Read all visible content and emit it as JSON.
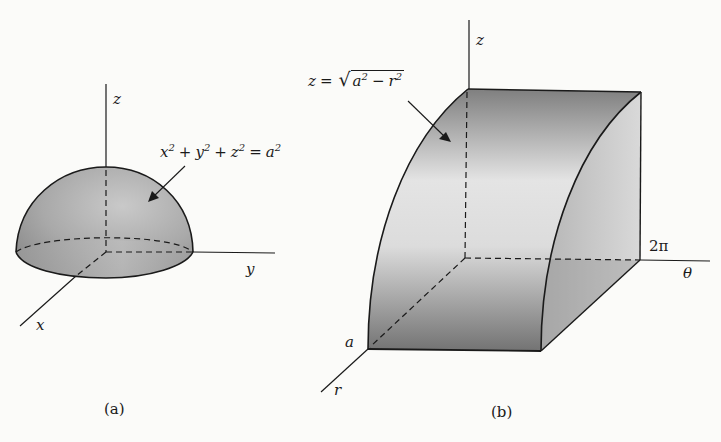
{
  "figure": {
    "panel_a": {
      "caption": "(a)",
      "axes": {
        "x": "x",
        "y": "y",
        "z": "z"
      },
      "surface_label": {
        "t1": "x",
        "e1": "2",
        "op1": "+",
        "t2": "y",
        "e2": "2",
        "op2": "+",
        "t3": "z",
        "e3": "2",
        "op3": "=",
        "t4": "a",
        "e4": "2"
      },
      "shape": "hemisphere"
    },
    "panel_b": {
      "caption": "(b)",
      "axes": {
        "r": "r",
        "theta": "θ",
        "z": "z"
      },
      "tick_labels": {
        "r_max": "a",
        "theta_max": "2π"
      },
      "surface_label": {
        "lhs": "z",
        "op": "=",
        "sqrt": "√",
        "t1": "a",
        "e1": "2",
        "minus": "−",
        "t2": "r",
        "e2": "2"
      },
      "shape": "quarter-cylinder slab"
    },
    "colors": {
      "line": "#1a1a1a",
      "shade_dark": "#7d7d7d",
      "shade_light": "#e6e6e6",
      "background": "#fbfbf9"
    }
  }
}
